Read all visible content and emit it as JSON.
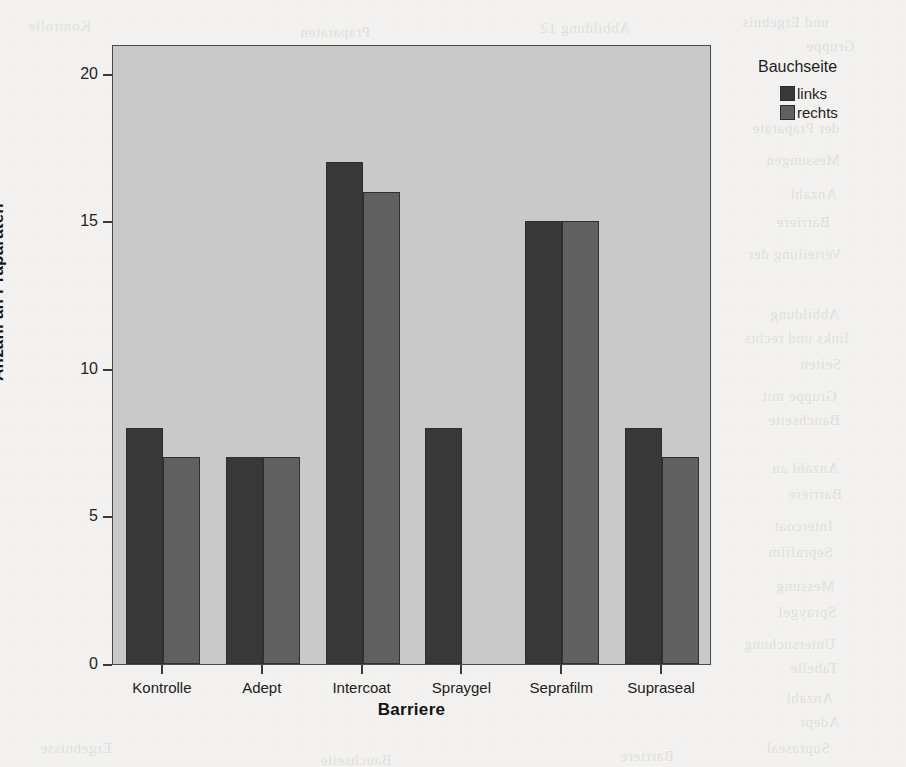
{
  "chart_data": {
    "type": "bar",
    "title": "",
    "subtitle": "",
    "xlabel": "Barriere",
    "ylabel": "Anzahl an Präparaten",
    "categories": [
      "Kontrolle",
      "Adept",
      "Intercoat",
      "Spraygel",
      "Seprafilm",
      "Supraseal"
    ],
    "series": [
      {
        "name": "links",
        "values": [
          8,
          7,
          17,
          8,
          15,
          8
        ],
        "color": "#383838"
      },
      {
        "name": "rechts",
        "values": [
          7,
          7,
          16,
          0,
          15,
          7
        ],
        "color": "#606060"
      }
    ],
    "legend_title": "Bauchseite",
    "legend_position": "right",
    "ylim": [
      0,
      21
    ],
    "y_ticks": [
      0,
      5,
      10,
      15,
      20
    ],
    "y_tick_labels": [
      "0",
      "5",
      "10",
      "15",
      "20"
    ],
    "grid": false,
    "plot_background": "#c9c9c9",
    "page_background": "#f5f4f2",
    "axis_color": "#4a4a4a"
  },
  "scan_bleed_lines": [
    {
      "text": "und Ergebnis",
      "x": 742,
      "y": 14
    },
    {
      "text": "Gruppe",
      "x": 806,
      "y": 38
    },
    {
      "text": "der Praparate",
      "x": 752,
      "y": 120
    },
    {
      "text": "Messungen",
      "x": 766,
      "y": 152
    },
    {
      "text": "Anzahl",
      "x": 790,
      "y": 186
    },
    {
      "text": "Barriere",
      "x": 776,
      "y": 214
    },
    {
      "text": "Verteilung der",
      "x": 748,
      "y": 246
    },
    {
      "text": "Abbildung",
      "x": 770,
      "y": 306
    },
    {
      "text": "links und rechts",
      "x": 744,
      "y": 330
    },
    {
      "text": "Seiten",
      "x": 800,
      "y": 356
    },
    {
      "text": "Gruppe mit",
      "x": 762,
      "y": 388
    },
    {
      "text": "Bauchseite",
      "x": 768,
      "y": 412
    },
    {
      "text": "Anzahl an",
      "x": 772,
      "y": 460
    },
    {
      "text": "Barriere",
      "x": 788,
      "y": 486
    },
    {
      "text": "Intercoat",
      "x": 774,
      "y": 518
    },
    {
      "text": "Seprafilm",
      "x": 768,
      "y": 544
    },
    {
      "text": "Messung",
      "x": 776,
      "y": 578
    },
    {
      "text": "Spraygel",
      "x": 778,
      "y": 604
    },
    {
      "text": "Untersuchung",
      "x": 744,
      "y": 636
    },
    {
      "text": "Tabelle",
      "x": 790,
      "y": 660
    },
    {
      "text": "Anzahl",
      "x": 786,
      "y": 690
    },
    {
      "text": "Adept",
      "x": 800,
      "y": 714
    },
    {
      "text": "Supraseal",
      "x": 766,
      "y": 740
    },
    {
      "text": "Kontrolle",
      "x": 28,
      "y": 18
    },
    {
      "text": "Praparaten",
      "x": 300,
      "y": 24
    },
    {
      "text": "Abbildung 12",
      "x": 540,
      "y": 20
    },
    {
      "text": "Ergebnisse",
      "x": 40,
      "y": 740
    },
    {
      "text": "Bauchseite",
      "x": 320,
      "y": 752
    },
    {
      "text": "Barriere",
      "x": 620,
      "y": 748
    }
  ]
}
